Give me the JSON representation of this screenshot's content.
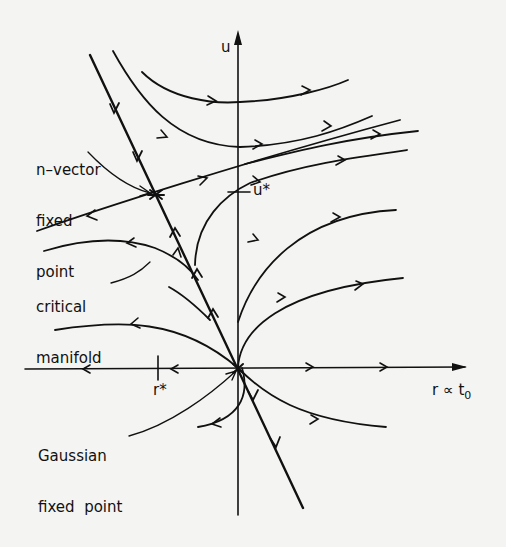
{
  "figure": {
    "ink_color": "#111111",
    "background_color": "#f4f4f2"
  },
  "axes": {
    "vertical_label": "u",
    "horizontal_label": "r ∝ t",
    "horizontal_label_subscript": "0",
    "tick_u_label": "u*",
    "tick_r_label": "r*"
  },
  "annotations": {
    "n_vector_line1": "n–vector",
    "n_vector_line2": "fixed",
    "n_vector_line3": "point",
    "critical_line1": "critical",
    "critical_line2": "manifold",
    "gaussian_line1": "Gaussian",
    "gaussian_line2": "fixed  point"
  },
  "fixed_points": [
    {
      "name": "Gaussian fixed point",
      "r": 0,
      "u": 0
    },
    {
      "name": "n-vector fixed point",
      "r": "r*",
      "u": "u*"
    }
  ],
  "flow_lines": [
    {
      "name": "critical-manifold",
      "direction": "toward n-vector fixed point from both ends"
    },
    {
      "name": "unstable-direction",
      "direction": "away from n-vector fixed point"
    },
    {
      "name": "r-axis",
      "direction": "away from Gaussian fixed point"
    },
    {
      "name": "trajectories-right",
      "direction": "toward large positive r"
    },
    {
      "name": "trajectories-left",
      "direction": "toward large negative r"
    }
  ]
}
